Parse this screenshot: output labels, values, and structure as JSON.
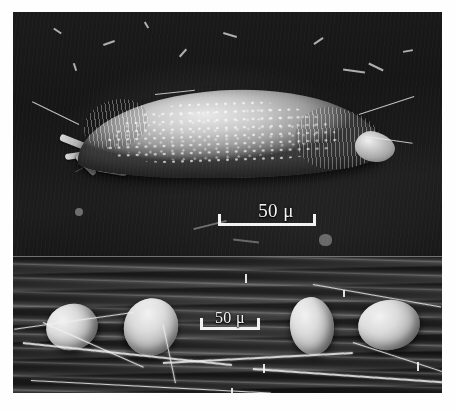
{
  "figure": {
    "type": "scanning-electron-micrograph",
    "panel_count": 2,
    "background_color": "#ffffff",
    "plate_color": "#141414"
  },
  "panels": [
    {
      "id": "upper",
      "name": "mite-panel",
      "subject": "mite",
      "subject_description": "arched mite with papillated dorsal cuticle, legs at left, gnathosoma at right",
      "background": "dark SEM stub field with scattered debris",
      "scale_bar": {
        "value": "50",
        "unit": "μ",
        "label": "50 μ",
        "color": "#f2f2f2",
        "style": "bracket"
      }
    },
    {
      "id": "lower",
      "name": "eggs-panel",
      "subject": "eggs",
      "subject_count": 4,
      "subject_description": "four ovoid eggs resting on a striated leaf surface with silk strands",
      "background": "horizontally striated leaf cuticle",
      "scale_bar": {
        "value": "50",
        "unit": "μ",
        "label": "50 μ",
        "color": "#f2f2f2",
        "style": "bracket"
      }
    }
  ],
  "eggs": [
    {
      "id": "egg-1",
      "position": "far-left"
    },
    {
      "id": "egg-2",
      "position": "left-center"
    },
    {
      "id": "egg-3",
      "position": "right-center"
    },
    {
      "id": "egg-4",
      "position": "far-right"
    }
  ]
}
